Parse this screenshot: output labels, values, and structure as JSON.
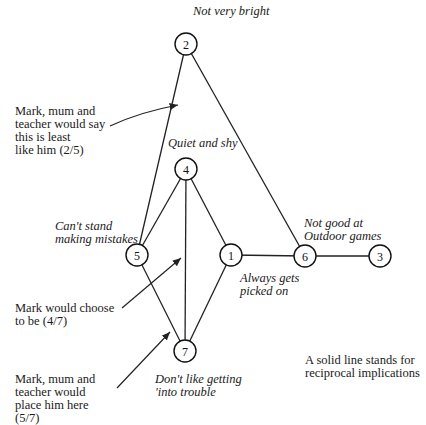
{
  "nodes": [
    {
      "id": "1",
      "label": "1",
      "x": 231,
      "y": 255,
      "caption": "Always gets\npicked on"
    },
    {
      "id": "2",
      "label": "2",
      "x": 186,
      "y": 44,
      "caption": "Not very bright"
    },
    {
      "id": "3",
      "label": "3",
      "x": 380,
      "y": 256,
      "caption": ""
    },
    {
      "id": "4",
      "label": "4",
      "x": 186,
      "y": 169,
      "caption": "Quiet and shy"
    },
    {
      "id": "5",
      "label": "5",
      "x": 137,
      "y": 255,
      "caption": "Can't stand\nmaking mistakes"
    },
    {
      "id": "6",
      "label": "6",
      "x": 305,
      "y": 256,
      "caption": "Not good at\nOutdoor games"
    },
    {
      "id": "7",
      "label": "7",
      "x": 185,
      "y": 351,
      "caption": "Don't like getting\n'into trouble"
    }
  ],
  "edges": [
    [
      "2",
      "5"
    ],
    [
      "2",
      "6"
    ],
    [
      "4",
      "5"
    ],
    [
      "4",
      "1"
    ],
    [
      "4",
      "7"
    ],
    [
      "5",
      "7"
    ],
    [
      "1",
      "7"
    ],
    [
      "1",
      "6"
    ],
    [
      "6",
      "3"
    ]
  ],
  "annotations": {
    "least_like": "Mark, mum and\nteacher would say\nthis is least\nlike him (2/5)",
    "would_choose": "Mark would choose\nto be (4/7)",
    "place_him": "Mark, mum and\nteacher would\nplace him here\n(5/7)",
    "legend": "A solid line stands for\nreciprocal implications"
  }
}
